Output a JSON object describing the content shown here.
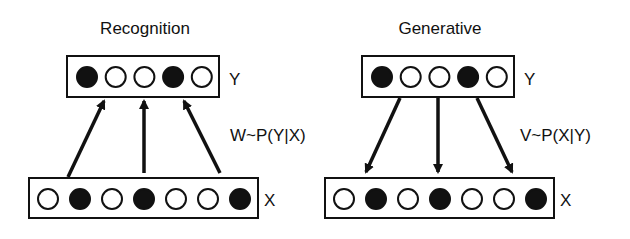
{
  "panels": [
    {
      "title": "Recognition",
      "top_layer_label": "Y",
      "bottom_layer_label": "X",
      "weight_label": "W~P(Y|X)",
      "direction": "up",
      "top_units": [
        1,
        0,
        0,
        1,
        0
      ],
      "bottom_units": [
        0,
        1,
        0,
        1,
        0,
        0,
        1
      ]
    },
    {
      "title": "Generative",
      "top_layer_label": "Y",
      "bottom_layer_label": "X",
      "weight_label": "V~P(X|Y)",
      "direction": "down",
      "top_units": [
        1,
        0,
        0,
        1,
        0
      ],
      "bottom_units": [
        0,
        1,
        0,
        1,
        0,
        0,
        1
      ]
    }
  ],
  "colors": {
    "stroke": "#111111",
    "filled": "#111111",
    "empty": "#ffffff"
  }
}
